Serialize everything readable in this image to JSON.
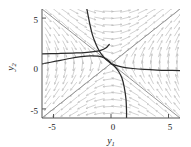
{
  "chart_data": {
    "type": "line",
    "title": "",
    "subtitle": "",
    "xlabel": "y1",
    "ylabel": "y2",
    "xlabel_base": "y",
    "xlabel_sub": "1",
    "ylabel_base": "y",
    "ylabel_sub": "2",
    "xlim": [
      -6,
      6
    ],
    "ylim": [
      -6,
      6
    ],
    "grid": false,
    "legend": null,
    "legend_position": "none",
    "xticks": [
      -5,
      0,
      5
    ],
    "yticks": [
      -5,
      0,
      5
    ],
    "xticklabels": [
      "-5",
      "0",
      "5"
    ],
    "yticklabels": [
      "-5",
      "0",
      "5"
    ],
    "plot_kind": "phase-portrait-direction-field",
    "equilibrium": {
      "type": "saddle",
      "x": 0,
      "y": 0
    },
    "colors": {
      "trajectory": "#2b2b2b",
      "separatrix": "#8a8a8a",
      "field_arrow": "#b9b9b9",
      "frame": "#555555",
      "text": "#1a1a1a",
      "background": "#ffffff"
    },
    "separatrices": [
      {
        "name": "unstable-eigenline",
        "equation": "y2 = y1",
        "slope": 1,
        "from": [
          -6,
          -6
        ],
        "to": [
          6,
          6
        ]
      },
      {
        "name": "stable-eigenline",
        "equation": "y2 = -y1",
        "slope": -1,
        "from": [
          -6,
          6
        ],
        "to": [
          6,
          -6
        ]
      }
    ],
    "direction_field": {
      "x_samples": [
        -5.5,
        -4.75,
        -4.0,
        -3.25,
        -2.5,
        -1.75,
        -1.0,
        -0.25,
        0.5,
        1.25,
        2.0,
        2.75,
        3.5,
        4.25,
        5.0,
        5.75
      ],
      "y_samples": [
        -5.5,
        -4.75,
        -4.0,
        -3.25,
        -2.5,
        -1.75,
        -1.0,
        -0.25,
        0.5,
        1.25,
        2.0,
        2.75,
        3.5,
        4.25,
        5.0,
        5.75
      ],
      "system": "dy1/dt = y2, dy2/dt = y1",
      "arrow_length": 5.2
    },
    "trajectories": [
      {
        "name": "upper-branch-left",
        "points": [
          [
            -2.1,
            6.0
          ],
          [
            -1.85,
            4.4
          ],
          [
            -1.6,
            3.1
          ],
          [
            -1.3,
            2.1
          ],
          [
            -1.0,
            1.35
          ],
          [
            -0.7,
            0.8
          ],
          [
            -0.35,
            0.35
          ],
          [
            0.0,
            0.0
          ]
        ]
      },
      {
        "name": "upper-branch-right",
        "points": [
          [
            0.0,
            0.0
          ],
          [
            0.3,
            -0.3
          ],
          [
            0.65,
            -0.85
          ],
          [
            0.95,
            -1.6
          ],
          [
            1.15,
            -2.6
          ],
          [
            1.3,
            -3.9
          ],
          [
            1.35,
            -5.2
          ],
          [
            1.35,
            -6.0
          ]
        ]
      },
      {
        "name": "left-incoming",
        "points": [
          [
            -6.0,
            -0.05
          ],
          [
            -4.8,
            0.25
          ],
          [
            -3.6,
            0.55
          ],
          [
            -2.6,
            0.75
          ],
          [
            -1.8,
            0.85
          ],
          [
            -1.1,
            0.8
          ],
          [
            -0.55,
            0.6
          ],
          [
            -0.15,
            0.25
          ],
          [
            0.0,
            0.0
          ]
        ]
      },
      {
        "name": "right-outgoing",
        "points": [
          [
            0.0,
            0.0
          ],
          [
            0.4,
            -0.2
          ],
          [
            1.0,
            -0.4
          ],
          [
            1.9,
            -0.55
          ],
          [
            2.9,
            -0.65
          ],
          [
            4.0,
            -0.72
          ],
          [
            5.1,
            -0.76
          ],
          [
            6.0,
            -0.78
          ]
        ]
      },
      {
        "name": "upper-left-hyperbola",
        "points": [
          [
            -6.0,
            1.05
          ],
          [
            -4.6,
            1.1
          ],
          [
            -3.3,
            1.15
          ],
          [
            -2.3,
            1.2
          ],
          [
            -1.5,
            1.3
          ],
          [
            -0.9,
            1.45
          ],
          [
            -0.45,
            1.7
          ],
          [
            -0.15,
            2.1
          ]
        ]
      }
    ]
  }
}
